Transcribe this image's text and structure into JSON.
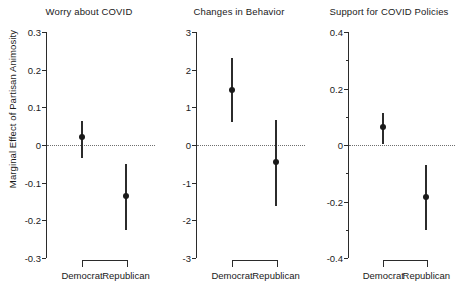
{
  "figure": {
    "ylabel": "Marginal Effect of Partisan Animosity",
    "categories": [
      "Democrat",
      "Republican"
    ]
  },
  "chart_data": {
    "type": "scatter",
    "title": "",
    "xlabel": "",
    "ylabel": "Marginal Effect of Partisan Animosity",
    "grid": false,
    "legend": "none",
    "note": "Three-panel coefficient / dot-and-whisker plot. Each panel shows point estimates with vertical confidence interval bars for two partisan groups. A dotted horizontal reference line is drawn at y = 0.",
    "panels": [
      {
        "title": "Worry about COVID",
        "ylim": [
          -0.3,
          0.3
        ],
        "yticks": [
          0.3,
          0.2,
          0.1,
          0,
          -0.1,
          -0.2,
          -0.3
        ],
        "yticklabels": [
          "0.3",
          "0.2",
          "0.1",
          "0",
          "-0.1",
          "-0.2",
          "-0.3"
        ],
        "minor_yticks": [],
        "zero_line": 0,
        "categories": [
          "Democrat",
          "Republican"
        ],
        "estimates": [
          0.02,
          -0.135
        ],
        "ci_low": [
          -0.035,
          -0.225
        ],
        "ci_high": [
          0.065,
          -0.05
        ]
      },
      {
        "title": "Changes in Behavior",
        "ylim": [
          -3,
          3
        ],
        "yticks": [
          3,
          2,
          1,
          0,
          -1,
          -2,
          -3
        ],
        "yticklabels": [
          "3",
          "2",
          "1",
          "0",
          "-1",
          "-2",
          "-3"
        ],
        "minor_yticks": [],
        "zero_line": 0,
        "categories": [
          "Democrat",
          "Republican"
        ],
        "estimates": [
          1.45,
          -0.45
        ],
        "ci_low": [
          0.62,
          -1.62
        ],
        "ci_high": [
          2.3,
          0.67
        ]
      },
      {
        "title": "Support for COVID Policies",
        "ylim": [
          -0.4,
          0.4
        ],
        "yticks": [
          0.4,
          0.2,
          0,
          -0.2,
          -0.4
        ],
        "yticklabels": [
          "0.4",
          "0.2",
          "0",
          "-0.2",
          "-0.4"
        ],
        "minor_yticks": [
          0.3,
          0.1,
          -0.1,
          -0.3
        ],
        "zero_line": 0,
        "categories": [
          "Democrat",
          "Republican"
        ],
        "estimates": [
          0.065,
          -0.185
        ],
        "ci_low": [
          0.005,
          -0.3
        ],
        "ci_high": [
          0.115,
          -0.07
        ]
      }
    ]
  }
}
